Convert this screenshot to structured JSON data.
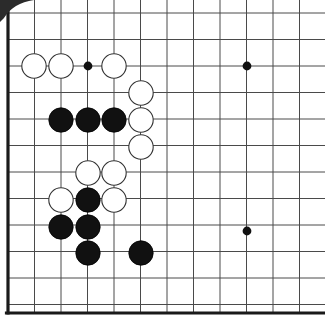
{
  "diagram": {
    "kind": "go-board-diagram",
    "board_size": 19,
    "crop": "upper-left region, right and top edges cut off",
    "geometry": {
      "origin_x": 8,
      "origin_y": 13,
      "spacing": 26.5,
      "columns_visible": 12,
      "rows_visible": 12,
      "left_edge_x": 8,
      "bottom_edge_y": 313,
      "edge_line_width": 3.2,
      "grid_line_width": 1.0,
      "stone_radius": 12.2
    },
    "colors": {
      "background": "#ffffff",
      "grid_line": "#4a4a4a",
      "edge_line": "#1a1a1a",
      "black_stone_fill": "#111111",
      "black_stone_stroke": "#000000",
      "white_stone_fill": "#ffffff",
      "white_stone_stroke": "#333333",
      "star_point": "#111111",
      "scan_artifact": "#2b2b2b"
    },
    "star_points": [
      {
        "name": "star-point-upper-left",
        "col": 3,
        "row": 2,
        "x": 88,
        "y": 66
      },
      {
        "name": "star-point-upper-middle",
        "col": 9,
        "row": 2,
        "x": 247,
        "y": 66
      },
      {
        "name": "star-point-middle-left",
        "col": 9,
        "row": 8,
        "x": 247,
        "y": 231
      },
      {
        "name": "star-point-radius",
        "r": 4.4
      }
    ],
    "stones": [
      {
        "id": "w1",
        "color": "white",
        "col": 1,
        "row": 2,
        "x": 34,
        "y": 66
      },
      {
        "id": "w2",
        "color": "white",
        "col": 2,
        "row": 2,
        "x": 61,
        "y": 66
      },
      {
        "id": "w3",
        "color": "white",
        "col": 4,
        "row": 2,
        "x": 114,
        "y": 66
      },
      {
        "id": "w4",
        "color": "white",
        "col": 5,
        "row": 3,
        "x": 141,
        "y": 93
      },
      {
        "id": "b1",
        "color": "black",
        "col": 2,
        "row": 4,
        "x": 61,
        "y": 120
      },
      {
        "id": "b2",
        "color": "black",
        "col": 3,
        "row": 4,
        "x": 88,
        "y": 120
      },
      {
        "id": "b3",
        "color": "black",
        "col": 4,
        "row": 4,
        "x": 114,
        "y": 120
      },
      {
        "id": "w5",
        "color": "white",
        "col": 5,
        "row": 4,
        "x": 141,
        "y": 120
      },
      {
        "id": "w6",
        "color": "white",
        "col": 5,
        "row": 5,
        "x": 141,
        "y": 147
      },
      {
        "id": "w7",
        "color": "white",
        "col": 3,
        "row": 6,
        "x": 88,
        "y": 173
      },
      {
        "id": "w8",
        "color": "white",
        "col": 4,
        "row": 6,
        "x": 114,
        "y": 173
      },
      {
        "id": "w9",
        "color": "white",
        "col": 2,
        "row": 7,
        "x": 61,
        "y": 200
      },
      {
        "id": "b4",
        "color": "black",
        "col": 3,
        "row": 7,
        "x": 88,
        "y": 200
      },
      {
        "id": "w10",
        "color": "white",
        "col": 4,
        "row": 7,
        "x": 114,
        "y": 200
      },
      {
        "id": "b5",
        "color": "black",
        "col": 2,
        "row": 8,
        "x": 61,
        "y": 227
      },
      {
        "id": "b6",
        "color": "black",
        "col": 3,
        "row": 8,
        "x": 88,
        "y": 227
      },
      {
        "id": "b7",
        "color": "black",
        "col": 3,
        "row": 9,
        "x": 88,
        "y": 253
      },
      {
        "id": "b8",
        "color": "black",
        "col": 5,
        "row": 9,
        "x": 141,
        "y": 253
      }
    ],
    "counts": {
      "black_stones": 8,
      "white_stones": 10,
      "total_stones": 18
    }
  }
}
